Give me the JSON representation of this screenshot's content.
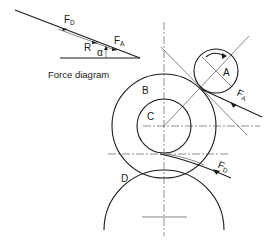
{
  "diagram": {
    "force_diagram": {
      "caption": "Force diagram",
      "labels": {
        "fd_main": "F",
        "fd_sub": "D",
        "r": "R",
        "fa_main": "F",
        "fa_sub": "A",
        "alpha": "α"
      }
    },
    "rollers": {
      "a": "A",
      "b": "B",
      "c": "C",
      "d": "D"
    },
    "forces": {
      "fa_main": "F",
      "fa_sub": "A",
      "fd_main": "F",
      "fd_sub": "D"
    },
    "colors": {
      "ink": "#1a1a1a",
      "background": "#ffffff"
    }
  }
}
